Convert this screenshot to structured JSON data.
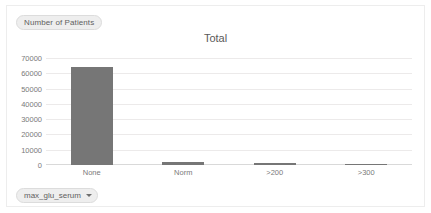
{
  "widget": {
    "measure_pill_label": "Number of Patients",
    "dimension_pill_label": "max_glu_serum",
    "dropdown_icon": "chevron-down-icon",
    "bar_color": "#767676",
    "grid_color": "#eceaea",
    "text_color": "#7a7a7a"
  },
  "chart_data": {
    "type": "bar",
    "title": "Total",
    "xlabel": "",
    "ylabel": "Number of Patients",
    "categories": [
      "None",
      "Norm",
      ">200",
      ">300"
    ],
    "values": [
      64000,
      2100,
      1000,
      700
    ],
    "series": [
      {
        "name": "Number of Patients",
        "values": [
          64000,
          2100,
          1000,
          700
        ]
      }
    ],
    "ylim": [
      0,
      70000
    ],
    "yticks": [
      70000,
      60000,
      50000,
      40000,
      30000,
      20000,
      10000,
      0
    ],
    "ytick_labels": [
      "70000",
      "60000",
      "50000",
      "40000",
      "30000",
      "20000",
      "10000",
      "0"
    ],
    "grid": true,
    "legend": "none"
  }
}
